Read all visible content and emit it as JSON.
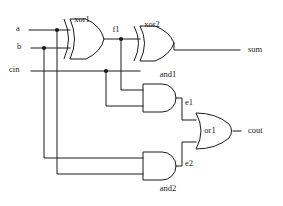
{
  "diagram": {
    "line_color": "#1a1a1a",
    "background_color": "#ffffff"
  },
  "inputs": [
    {
      "id": "a",
      "label": "a",
      "x": 16,
      "y": 28
    },
    {
      "id": "b",
      "label": "b",
      "x": 16,
      "y": 47
    },
    {
      "id": "cin",
      "label": "cin",
      "x": 16,
      "y": 67
    }
  ],
  "outputs": [
    {
      "id": "sum",
      "label": "sum",
      "x": 250,
      "y": 50
    },
    {
      "id": "cout",
      "label": "cout",
      "x": 250,
      "y": 131
    }
  ],
  "gates": [
    {
      "id": "xor1",
      "type": "xor",
      "label": "xor1",
      "label_x": 82,
      "label_y": 20
    },
    {
      "id": "xor2",
      "type": "xor",
      "label": "xor2",
      "label_x": 152,
      "label_y": 25
    },
    {
      "id": "and1",
      "type": "and",
      "label": "and1",
      "label_x": 168,
      "label_y": 75
    },
    {
      "id": "and2",
      "type": "and",
      "label": "and2",
      "label_x": 168,
      "label_y": 188
    },
    {
      "id": "or1",
      "type": "or",
      "label": "or1",
      "label_x": 209,
      "label_y": 129
    }
  ],
  "nets": [
    {
      "id": "f1",
      "label": "f1",
      "label_x": 116,
      "label_y": 39
    },
    {
      "id": "e1",
      "label": "e1",
      "label_x": 186,
      "label_y": 103
    },
    {
      "id": "e2",
      "label": "e2",
      "label_x": 186,
      "label_y": 163
    }
  ],
  "junctions": [
    {
      "id": "a-tap",
      "x": 57,
      "y": 30
    },
    {
      "id": "b-tap",
      "x": 44,
      "y": 48
    },
    {
      "id": "f1-tap",
      "x": 121,
      "y": 47
    },
    {
      "id": "cin-tap",
      "x": 106,
      "y": 71
    }
  ]
}
